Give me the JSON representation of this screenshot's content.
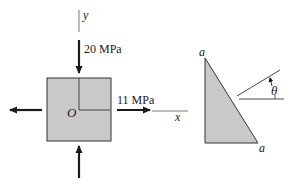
{
  "figure": {
    "element": {
      "y_axis_label": "y",
      "x_axis_label": "x",
      "origin_label": "O",
      "vertical_stress_label": "20 MPa",
      "horizontal_stress_label": "11 MPa",
      "fill_color": "#c9c9c9"
    },
    "wedge": {
      "top_label": "a",
      "bottom_label": "a",
      "angle_label": "θ",
      "fill_color": "#c9c9c9"
    }
  }
}
